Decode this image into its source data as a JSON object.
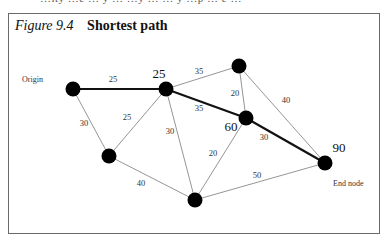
{
  "figure": {
    "number": "Figure 9.4",
    "title": "Shortest path"
  },
  "top_strip_text": "…ity …e … y …  …y … … y …p … e …",
  "nodes": [
    {
      "id": "origin",
      "x": 73,
      "y": 89,
      "caption": "Origin",
      "value": ""
    },
    {
      "id": "a",
      "x": 166,
      "y": 89,
      "caption": "",
      "value": "25"
    },
    {
      "id": "top",
      "x": 239,
      "y": 66,
      "caption": "",
      "value": ""
    },
    {
      "id": "mid",
      "x": 246,
      "y": 118,
      "caption": "",
      "value": "60"
    },
    {
      "id": "end",
      "x": 325,
      "y": 163,
      "caption": "End node",
      "value": "90"
    },
    {
      "id": "lower_left",
      "x": 109,
      "y": 156,
      "caption": "",
      "value": ""
    },
    {
      "id": "bottom",
      "x": 195,
      "y": 200,
      "caption": "",
      "value": ""
    }
  ],
  "edges": [
    {
      "from": "origin",
      "to": "a",
      "weight": "25",
      "on_path": true
    },
    {
      "from": "origin",
      "to": "lower_left",
      "weight": "30",
      "on_path": false
    },
    {
      "from": "lower_left",
      "to": "a",
      "weight": "25",
      "on_path": false
    },
    {
      "from": "a",
      "to": "bottom",
      "weight": "30",
      "on_path": false
    },
    {
      "from": "a",
      "to": "top",
      "weight": "35",
      "on_path": false
    },
    {
      "from": "a",
      "to": "mid",
      "weight": "35",
      "on_path": true
    },
    {
      "from": "top",
      "to": "mid",
      "weight": "20",
      "on_path": false
    },
    {
      "from": "top",
      "to": "end",
      "weight": "40",
      "on_path": false
    },
    {
      "from": "mid",
      "to": "end",
      "weight": "30",
      "on_path": true
    },
    {
      "from": "mid",
      "to": "bottom",
      "weight": "20",
      "on_path": false
    },
    {
      "from": "lower_left",
      "to": "bottom",
      "weight": "40",
      "on_path": false
    },
    {
      "from": "bottom",
      "to": "end",
      "weight": "50",
      "on_path": false
    }
  ],
  "labels": {
    "origin": "Origin",
    "end_node": "End node",
    "value_a": "25",
    "value_mid": "60",
    "value_end": "90",
    "w_origin_a": "25",
    "w_origin_ll": "30",
    "w_ll_a": "25",
    "w_a_bottom": "30",
    "w_a_top": "35",
    "w_a_mid": "35",
    "w_top_mid": "20",
    "w_top_end": "40",
    "w_mid_end": "30",
    "w_mid_bottom": "20",
    "w_ll_bottom": "40",
    "w_bottom_end": "50"
  },
  "colors": {
    "node": "#000000",
    "path_edge": "#111111",
    "edge": "#777777",
    "frame": "#6a6a6a"
  }
}
